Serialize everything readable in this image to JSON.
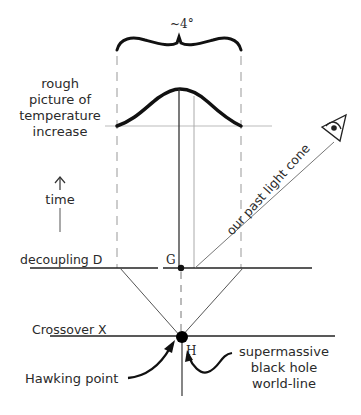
{
  "diagram": {
    "angle_label": "~4°",
    "temperature_label": [
      "rough",
      "picture of",
      "temperature",
      "increase"
    ],
    "time_label": "time",
    "decoupling_label": "decoupling D",
    "point_g_label": "G",
    "light_cone_label": "our past light cone",
    "crossover_label": "Crossover X",
    "point_h_label": "H",
    "hawking_label": "Hawking point",
    "black_hole_label": [
      "supermassive",
      "black hole",
      "world-line"
    ],
    "eye_icon": "eye-icon",
    "colors": {
      "ink": "#111111",
      "text": "#2a2a2a",
      "light_line": "#777777",
      "dashed": "#999999"
    }
  }
}
